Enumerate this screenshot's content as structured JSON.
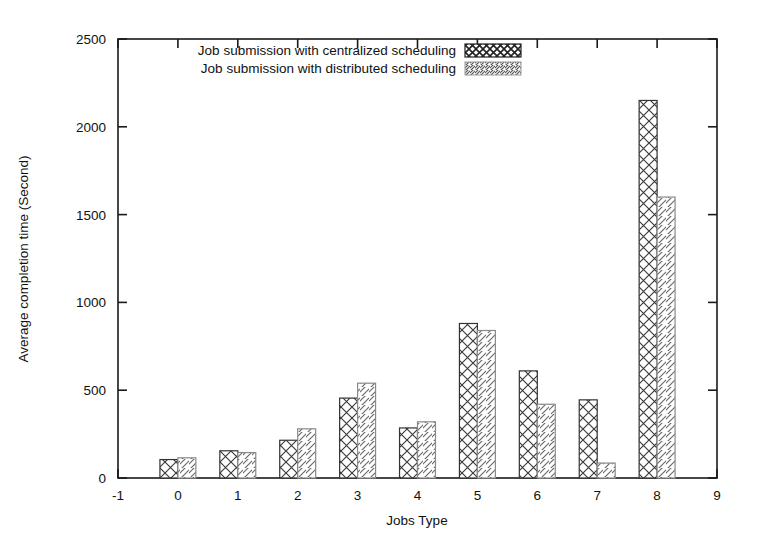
{
  "chart_data": {
    "type": "bar",
    "title": "",
    "xlabel": "Jobs Type",
    "ylabel": "Average completion time (Second)",
    "categories": [
      "0",
      "1",
      "2",
      "3",
      "4",
      "5",
      "6",
      "7",
      "8"
    ],
    "series": [
      {
        "name": "Job submission with centralized scheduling",
        "pattern": "crosshatch",
        "values": [
          105,
          155,
          215,
          455,
          285,
          880,
          610,
          445,
          2150
        ]
      },
      {
        "name": "Job submission with distributed scheduling",
        "pattern": "diagonal-lines",
        "values": [
          115,
          145,
          280,
          540,
          320,
          840,
          420,
          85,
          1600
        ]
      }
    ],
    "xlim": [
      -1,
      9
    ],
    "ylim": [
      0,
      2500
    ],
    "x_tick_labels": [
      "-1",
      "0",
      "1",
      "2",
      "3",
      "4",
      "5",
      "6",
      "7",
      "8",
      "9"
    ],
    "y_tick_labels": [
      "0",
      "500",
      "1000",
      "1500",
      "2000",
      "2500"
    ],
    "y_ticks": [
      0,
      500,
      1000,
      1500,
      2000,
      2500
    ],
    "grid": false,
    "legend_position": "top-center",
    "frame": "box",
    "colors": {
      "axis": "#1a1a1a",
      "text": "#111111",
      "bar_outline": "#333333",
      "background": "#ffffff"
    }
  },
  "legend": {
    "entries": [
      {
        "label": "Job submission with centralized scheduling",
        "swatch": "crosshatch-swatch"
      },
      {
        "label": "Job submission with distributed scheduling",
        "swatch": "diagonal-swatch"
      }
    ]
  },
  "axes": {
    "y_title": "Average completion time (Second)",
    "x_title": "Jobs Type"
  }
}
